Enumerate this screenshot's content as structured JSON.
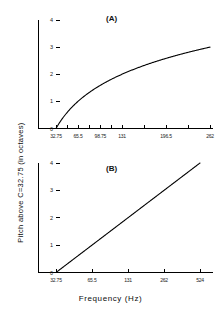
{
  "figure": {
    "axis_titles": {
      "y": "Pitch above C=32.75 (in octaves)",
      "x": "Frequency (Hz)"
    }
  },
  "chart_data": [
    {
      "type": "line",
      "panel": "(A)",
      "title": "(A)",
      "xlabel": "Frequency (Hz)",
      "ylabel": "Pitch above C=32.75 (in octaves)",
      "x_scale": "linear",
      "y_scale": "linear",
      "xlim": [
        32.75,
        262
      ],
      "ylim": [
        0,
        4
      ],
      "grid": false,
      "legend": "none",
      "xticks": [
        32.75,
        65.5,
        98.75,
        131,
        196.5,
        262
      ],
      "xticklabels": [
        "32.75",
        "65.5",
        "98.75",
        "131",
        "196.5",
        "262"
      ],
      "yticks": [
        0,
        1,
        2,
        3,
        4
      ],
      "yticklabels": [
        "0",
        "1",
        "2",
        "3",
        "4"
      ],
      "series": [
        {
          "name": "pitch vs frequency (linear axis)",
          "relation": "y = log2(x / 32.75)",
          "x": [
            32.75,
            40,
            45,
            50,
            55,
            60,
            65.5,
            72,
            80,
            90,
            98.75,
            110,
            120,
            131,
            145,
            160,
            175,
            196.5,
            215,
            235,
            262
          ],
          "values": [
            0.0,
            0.29,
            0.46,
            0.61,
            0.75,
            0.87,
            1.0,
            1.14,
            1.29,
            1.46,
            1.59,
            1.75,
            1.87,
            2.0,
            2.15,
            2.29,
            2.42,
            2.58,
            2.72,
            2.84,
            3.0
          ]
        }
      ]
    },
    {
      "type": "line",
      "panel": "(B)",
      "title": "(B)",
      "xlabel": "Frequency (Hz)",
      "ylabel": "Pitch above C=32.75 (in octaves)",
      "x_scale": "log2",
      "y_scale": "linear",
      "xlim": [
        32.75,
        524
      ],
      "ylim": [
        0,
        4
      ],
      "grid": false,
      "legend": "none",
      "xticks": [
        32.75,
        65.5,
        131,
        262,
        524
      ],
      "xticklabels": [
        "32.75",
        "65.5",
        "131",
        "262",
        "524"
      ],
      "yticks": [
        0,
        1,
        2,
        3,
        4
      ],
      "yticklabels": [
        "0",
        "1",
        "2",
        "3",
        "4"
      ],
      "series": [
        {
          "name": "pitch vs frequency (log axis)",
          "relation": "y = log2(x / 32.75)",
          "x": [
            32.75,
            65.5,
            131,
            262,
            524
          ],
          "values": [
            0.0,
            1.0,
            2.0,
            3.0,
            4.0
          ]
        }
      ]
    }
  ],
  "panel_a": {
    "label": "(A)",
    "xticklabels": [
      "32.75",
      "65.5",
      "98.75",
      "131",
      "196.5",
      "262"
    ],
    "yticklabels": [
      "0",
      "1",
      "2",
      "3",
      "4"
    ]
  },
  "panel_b": {
    "label": "(B)",
    "xticklabels": [
      "32.75",
      "65.5",
      "131",
      "262",
      "524"
    ],
    "yticklabels": [
      "0",
      "1",
      "2",
      "3",
      "4"
    ]
  }
}
